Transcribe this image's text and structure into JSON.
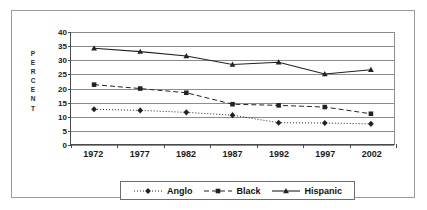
{
  "chart_data": {
    "type": "line",
    "title": "",
    "xlabel": "",
    "ylabel": "PERCENT",
    "categories": [
      "1972",
      "1977",
      "1982",
      "1987",
      "1992",
      "1997",
      "2002"
    ],
    "ylim": [
      0,
      40
    ],
    "ytick_step": 5,
    "yticks": [
      "0",
      "5",
      "10",
      "15",
      "20",
      "25",
      "30",
      "35",
      "40"
    ],
    "grid": true,
    "legend_position": "bottom",
    "series": [
      {
        "name": "Anglo",
        "marker": "diamond",
        "line_style": "dotted",
        "color": "#222222",
        "values": [
          12.4,
          12.0,
          11.3,
          10.3,
          7.6,
          7.5,
          7.2
        ]
      },
      {
        "name": "Black",
        "marker": "square",
        "line_style": "dashed",
        "color": "#222222",
        "values": [
          21.2,
          19.8,
          18.3,
          14.2,
          13.8,
          13.2,
          10.8
        ]
      },
      {
        "name": "Hispanic",
        "marker": "triangle",
        "line_style": "solid",
        "color": "#222222",
        "values": [
          34.2,
          33.0,
          31.4,
          28.4,
          29.2,
          25.0,
          26.5
        ]
      }
    ]
  },
  "axis": {
    "y_title_letters": [
      "P",
      "E",
      "R",
      "C",
      "E",
      "N",
      "T"
    ]
  },
  "colors": {
    "gridline": "#8c8c8c",
    "axis": "#4a4a4a",
    "frame": "#9a9a9a",
    "text": "#1a1a1a",
    "series": "#222222"
  }
}
